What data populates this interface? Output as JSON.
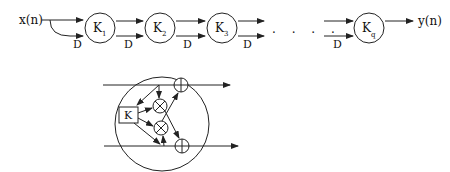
{
  "top_chain": {
    "input_label": "x(n)",
    "output_label": "y(n)",
    "delay_label": "D",
    "ellipsis": ". . . .",
    "stages": [
      {
        "name": "K",
        "sub": "1"
      },
      {
        "name": "K",
        "sub": "2"
      },
      {
        "name": "K",
        "sub": "3"
      },
      {
        "name": "K",
        "sub": "q"
      }
    ]
  },
  "detail": {
    "coefficient_label": "K",
    "multiplier_symbol": "⊗",
    "adder_symbol": "⊕"
  },
  "colors": {
    "stroke": "#222222",
    "background": "#ffffff"
  }
}
